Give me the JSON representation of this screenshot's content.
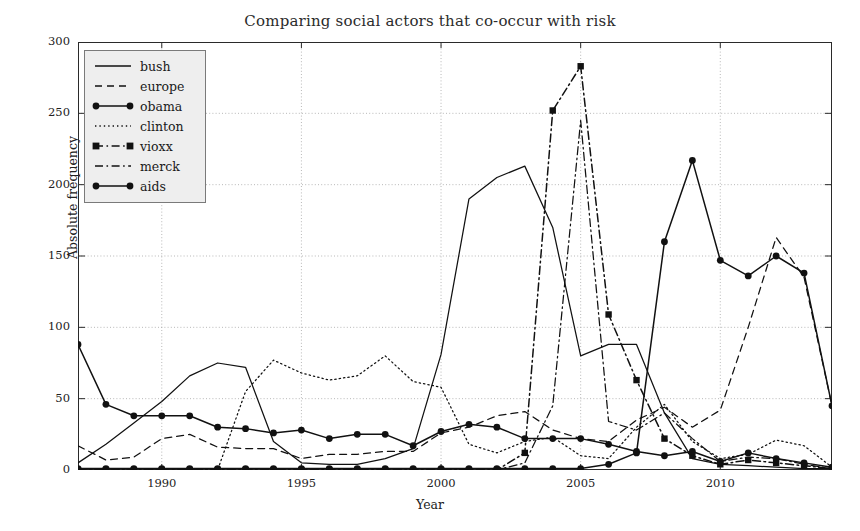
{
  "chart_data": {
    "type": "line",
    "title": "Comparing social actors that co-occur with risk",
    "xlabel": "Year",
    "ylabel": "Absolute frequency",
    "xlim": [
      1987,
      2014
    ],
    "ylim": [
      0,
      300
    ],
    "grid": true,
    "legend_position": "upper-left",
    "xticks": [
      1990,
      1995,
      2000,
      2005,
      2010
    ],
    "yticks": [
      0,
      50,
      100,
      150,
      200,
      250,
      300
    ],
    "x": [
      1987,
      1988,
      1989,
      1990,
      1991,
      1992,
      1993,
      1994,
      1995,
      1996,
      1997,
      1998,
      1999,
      2000,
      2001,
      2002,
      2003,
      2004,
      2005,
      2006,
      2007,
      2008,
      2009,
      2010,
      2011,
      2012,
      2013,
      2014
    ],
    "series": [
      {
        "name": "bush",
        "style": "solid",
        "marker": "none",
        "values": [
          5,
          18,
          33,
          48,
          66,
          75,
          72,
          20,
          5,
          4,
          4,
          8,
          15,
          81,
          190,
          205,
          213,
          170,
          80,
          88,
          88,
          40,
          8,
          4,
          3,
          2,
          1,
          1
        ]
      },
      {
        "name": "europe",
        "style": "dashed",
        "marker": "none",
        "values": [
          17,
          7,
          9,
          22,
          25,
          16,
          15,
          15,
          8,
          11,
          11,
          13,
          13,
          26,
          30,
          38,
          41,
          28,
          22,
          20,
          35,
          44,
          30,
          42,
          100,
          163,
          135,
          45
        ]
      },
      {
        "name": "obama",
        "style": "solid",
        "marker": "circle",
        "values": [
          1,
          1,
          1,
          1,
          1,
          1,
          1,
          1,
          1,
          1,
          1,
          1,
          1,
          1,
          1,
          1,
          1,
          1,
          1,
          4,
          12,
          160,
          217,
          147,
          136,
          150,
          138,
          45
        ]
      },
      {
        "name": "clinton",
        "style": "dotted",
        "marker": "none",
        "values": [
          0,
          0,
          0,
          0,
          0,
          0,
          55,
          77,
          68,
          63,
          66,
          80,
          62,
          58,
          18,
          12,
          20,
          23,
          10,
          8,
          30,
          46,
          20,
          8,
          11,
          21,
          17,
          2
        ]
      },
      {
        "name": "vioxx",
        "style": "dashdot",
        "marker": "square",
        "values": [
          0,
          0,
          0,
          0,
          0,
          0,
          0,
          0,
          0,
          0,
          0,
          0,
          0,
          0,
          0,
          0,
          12,
          252,
          283,
          109,
          63,
          22,
          10,
          4,
          7,
          5,
          3,
          1
        ]
      },
      {
        "name": "merck",
        "style": "dashdot",
        "marker": "none",
        "values": [
          0,
          0,
          0,
          0,
          0,
          0,
          0,
          0,
          0,
          0,
          0,
          0,
          0,
          0,
          0,
          0,
          5,
          45,
          245,
          34,
          28,
          40,
          22,
          6,
          9,
          8,
          4,
          1
        ]
      },
      {
        "name": "aids",
        "style": "solid",
        "marker": "circle-filled",
        "values": [
          88,
          46,
          38,
          38,
          38,
          30,
          29,
          26,
          28,
          22,
          25,
          25,
          17,
          27,
          32,
          30,
          22,
          22,
          22,
          18,
          13,
          10,
          13,
          6,
          12,
          8,
          5,
          2
        ]
      }
    ]
  },
  "legend": {
    "items": [
      {
        "label": "bush",
        "symbol": "line-solid"
      },
      {
        "label": "europe",
        "symbol": "line-dashed"
      },
      {
        "label": "obama",
        "symbol": "line-solid-circle"
      },
      {
        "label": "clinton",
        "symbol": "line-dotted"
      },
      {
        "label": "vioxx",
        "symbol": "line-dashdot-square"
      },
      {
        "label": "merck",
        "symbol": "line-dashdot"
      },
      {
        "label": "aids",
        "symbol": "line-solid-circle"
      }
    ]
  },
  "axes": {
    "y_ticks": [
      "0",
      "50",
      "100",
      "150",
      "200",
      "250",
      "300"
    ],
    "x_ticks": [
      "1990",
      "1995",
      "2000",
      "2005",
      "2010"
    ]
  }
}
